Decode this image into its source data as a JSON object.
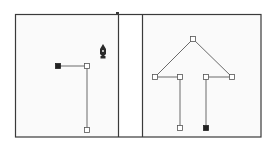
{
  "figure": {
    "colors": {
      "frame": "#3a3a3a",
      "path": "#6a6a6a",
      "anchor_fill_selected": "#222222",
      "anchor_fill_hollow": "#ffffff",
      "panel_bg": "#fafafa"
    },
    "panels": [
      {
        "name": "left-panel",
        "anchors": [
          {
            "x": 58,
            "y": 66,
            "type": "filled"
          },
          {
            "x": 87,
            "y": 66,
            "type": "hollow"
          },
          {
            "x": 87,
            "y": 130,
            "type": "hollow"
          }
        ],
        "cursor": {
          "icon": "pen-tool-cursor",
          "x": 103,
          "y": 51
        }
      },
      {
        "name": "right-panel",
        "anchors": [
          {
            "x": 193,
            "y": 39,
            "type": "hollow"
          },
          {
            "x": 155,
            "y": 77,
            "type": "hollow"
          },
          {
            "x": 180,
            "y": 77,
            "type": "hollow"
          },
          {
            "x": 180,
            "y": 128,
            "type": "hollow"
          },
          {
            "x": 232,
            "y": 77,
            "type": "hollow"
          },
          {
            "x": 206,
            "y": 77,
            "type": "hollow"
          },
          {
            "x": 206,
            "y": 128,
            "type": "filled"
          }
        ]
      }
    ]
  }
}
